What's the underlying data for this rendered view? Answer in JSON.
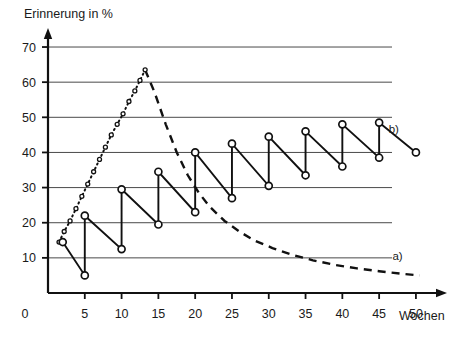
{
  "chart_data": {
    "type": "line",
    "title": "Erinnerung in %",
    "xlabel": "Wochen",
    "ylabel": "Erinnerung in %",
    "xlim": [
      0,
      53
    ],
    "ylim": [
      0,
      72
    ],
    "xticks": [
      0,
      5,
      10,
      15,
      20,
      25,
      30,
      35,
      40,
      45,
      50
    ],
    "xtick_labels": [
      "0",
      "5",
      "10",
      "15",
      "20",
      "25",
      "30",
      "35",
      "40",
      "45",
      "50"
    ],
    "yticks": [
      10,
      20,
      30,
      40,
      50,
      60,
      70
    ],
    "ytick_labels": [
      "10",
      "20",
      "30",
      "40",
      "50",
      "60",
      "70"
    ],
    "grid": "horizontal",
    "legend_position": "inline-annotations",
    "annotations": [
      {
        "text": "a)",
        "x": 47.5,
        "y": 9.5
      },
      {
        "text": "b)",
        "x": 47.0,
        "y": 45.5
      }
    ],
    "series": [
      {
        "name": "a) Vergessenskurve (ohne Wiederholung)",
        "style": "dotted-rising-then-dashed-decay",
        "label": "a)",
        "markers": "small-open-circle",
        "rising_points": [
          {
            "x": 1.5,
            "y": 14.5
          },
          {
            "x": 2.2,
            "y": 17.5
          },
          {
            "x": 3.0,
            "y": 20.5
          },
          {
            "x": 3.8,
            "y": 24.0
          },
          {
            "x": 4.6,
            "y": 27.5
          },
          {
            "x": 5.4,
            "y": 31.0
          },
          {
            "x": 6.2,
            "y": 34.5
          },
          {
            "x": 7.0,
            "y": 38.0
          },
          {
            "x": 7.8,
            "y": 41.5
          },
          {
            "x": 8.6,
            "y": 45.0
          },
          {
            "x": 9.4,
            "y": 48.0
          },
          {
            "x": 10.2,
            "y": 51.0
          },
          {
            "x": 11.0,
            "y": 54.5
          },
          {
            "x": 11.8,
            "y": 57.5
          },
          {
            "x": 12.5,
            "y": 60.5
          },
          {
            "x": 13.2,
            "y": 63.5
          }
        ],
        "decay_points": [
          {
            "x": 13.2,
            "y": 63.5
          },
          {
            "x": 14.5,
            "y": 57.0
          },
          {
            "x": 16.0,
            "y": 48.0
          },
          {
            "x": 17.5,
            "y": 40.0
          },
          {
            "x": 19.0,
            "y": 33.5
          },
          {
            "x": 20.5,
            "y": 28.5
          },
          {
            "x": 22.0,
            "y": 24.5
          },
          {
            "x": 24.0,
            "y": 20.5
          },
          {
            "x": 26.0,
            "y": 17.5
          },
          {
            "x": 28.0,
            "y": 15.0
          },
          {
            "x": 30.5,
            "y": 12.8
          },
          {
            "x": 33.0,
            "y": 11.0
          },
          {
            "x": 36.0,
            "y": 9.3
          },
          {
            "x": 39.0,
            "y": 8.0
          },
          {
            "x": 42.0,
            "y": 7.0
          },
          {
            "x": 45.0,
            "y": 6.2
          },
          {
            "x": 48.0,
            "y": 5.5
          },
          {
            "x": 50.5,
            "y": 5.0
          }
        ]
      },
      {
        "name": "b) Erinnerung mit Wiederholung (Sägezahn)",
        "style": "sawtooth-solid",
        "label": "b)",
        "markers": "open-circle",
        "points": [
          {
            "x": 2,
            "y": 14.5
          },
          {
            "x": 5,
            "y": 5.0
          },
          {
            "x": 5,
            "y": 22.0
          },
          {
            "x": 10,
            "y": 12.5
          },
          {
            "x": 10,
            "y": 29.5
          },
          {
            "x": 15,
            "y": 19.5
          },
          {
            "x": 15,
            "y": 34.5
          },
          {
            "x": 20,
            "y": 23.0
          },
          {
            "x": 20,
            "y": 40.0
          },
          {
            "x": 25,
            "y": 27.0
          },
          {
            "x": 25,
            "y": 42.5
          },
          {
            "x": 30,
            "y": 30.5
          },
          {
            "x": 30,
            "y": 44.5
          },
          {
            "x": 35,
            "y": 33.5
          },
          {
            "x": 35,
            "y": 46.0
          },
          {
            "x": 40,
            "y": 36.0
          },
          {
            "x": 40,
            "y": 48.0
          },
          {
            "x": 45,
            "y": 38.5
          },
          {
            "x": 45,
            "y": 48.5
          },
          {
            "x": 50,
            "y": 40.0
          }
        ]
      }
    ],
    "colors": {
      "axis": "#111111",
      "grid": "#4a4a4a",
      "series_a": "#111111",
      "series_b": "#111111",
      "background": "#ffffff"
    }
  }
}
